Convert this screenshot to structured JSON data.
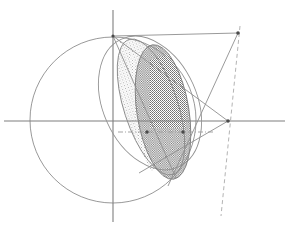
{
  "figure": {
    "type": "geometric-diagram",
    "canvas": {
      "width": 289,
      "height": 230,
      "background": "#ffffff"
    },
    "colors": {
      "axis": "#808080",
      "curve": "#8a8a8a",
      "line": "#8f8f8f",
      "dashed": "#a8a8a8",
      "dashdot": "#9a9a9a",
      "fill_light": "#d9d9d9",
      "fill_dark": "#8c8c8c",
      "point": "#4a4a4a"
    },
    "axes": {
      "x_axis": {
        "name": "horizontal-axis",
        "y": 121,
        "x1": 4,
        "x2": 285
      },
      "y_axis": {
        "name": "vertical-axis",
        "x": 113,
        "y1": 10,
        "y2": 222
      }
    },
    "circle": {
      "name": "base-circle",
      "cx": 113,
      "cy": 120,
      "r": 83
    },
    "ellipse_light": {
      "name": "light-shaded-ellipse",
      "cx": 151,
      "cy": 107,
      "rx": 27,
      "ry": 71,
      "rotation": -18,
      "fill": "#d9d9d9",
      "pattern": "fine-dot-stipple"
    },
    "ellipse_dark": {
      "name": "dark-shaded-ellipse",
      "cx": 163,
      "cy": 112,
      "rx": 26,
      "ry": 68,
      "rotation": -9,
      "fill": "#8c8c8c",
      "pattern": "dense-dot-stipple"
    },
    "ellipse_outline_outer": {
      "name": "outer-ellipse-outline",
      "cx": 150,
      "cy": 103,
      "rx": 47,
      "ry": 70,
      "rotation": -24
    },
    "points": [
      {
        "name": "apex-point",
        "x": 113,
        "y": 36
      },
      {
        "name": "right-vertex-point",
        "x": 228,
        "y": 121
      },
      {
        "name": "upper-right-point",
        "x": 238,
        "y": 33
      },
      {
        "name": "chord-left-point",
        "x": 147,
        "y": 132
      },
      {
        "name": "chord-right-point",
        "x": 183,
        "y": 132
      }
    ],
    "segments": [
      {
        "name": "apex-to-upper-right-horizontal",
        "x1": 113,
        "y1": 36,
        "x2": 238,
        "y2": 33
      },
      {
        "name": "apex-to-right-vertex-generator",
        "x1": 113,
        "y1": 36,
        "x2": 228,
        "y2": 121
      },
      {
        "name": "apex-to-lower-ellipse-generator",
        "x1": 113,
        "y1": 36,
        "x2": 176,
        "y2": 178
      },
      {
        "name": "upper-right-to-lower-generator",
        "x1": 238,
        "y1": 33,
        "x2": 168,
        "y2": 185
      },
      {
        "name": "right-vertex-to-lower-left",
        "x1": 228,
        "y1": 121,
        "x2": 140,
        "y2": 172
      }
    ],
    "dashed_line": {
      "name": "dashed-directrix",
      "x1": 240,
      "y1": 26,
      "x2": 221,
      "y2": 216
    },
    "dashdot_line": {
      "name": "dash-dot-chord-line",
      "x1": 118,
      "y1": 132,
      "x2": 214,
      "y2": 132
    }
  }
}
